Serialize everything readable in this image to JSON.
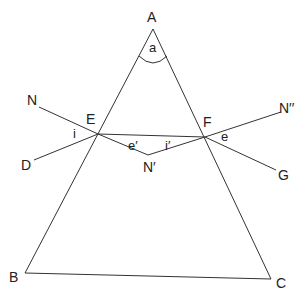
{
  "diagram": {
    "vertices": {
      "apex": "A",
      "base_left": "B",
      "base_right": "C"
    },
    "points": {
      "incidence_point": "E",
      "emergence_point": "F",
      "incident_ray_start": "N",
      "normal_extension": "D",
      "normals_intersection": "N′",
      "emergent_normal": "N′′",
      "emergent_ray_end": "G"
    },
    "angles": {
      "prism_angle": "a",
      "angle_of_incidence": "i",
      "angle_of_refraction": "e′",
      "internal_incidence": "i′",
      "angle_of_emergence": "e"
    }
  }
}
